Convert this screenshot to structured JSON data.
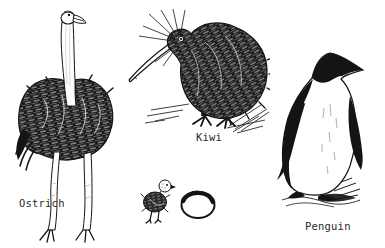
{
  "figure": {
    "background_color": "#ffffff",
    "ink_color": "#1a1a1a",
    "items": [
      {
        "id": "ostrich",
        "icon": "ostrich-illustration",
        "label": "Ostrich"
      },
      {
        "id": "kiwi",
        "icon": "kiwi-illustration",
        "label": "Kiwi"
      },
      {
        "id": "ostrich-chick-and-egg",
        "icon": "chick-and-egg-illustration",
        "label": ""
      },
      {
        "id": "penguin",
        "icon": "penguin-illustration",
        "label": "Penguin"
      }
    ]
  }
}
